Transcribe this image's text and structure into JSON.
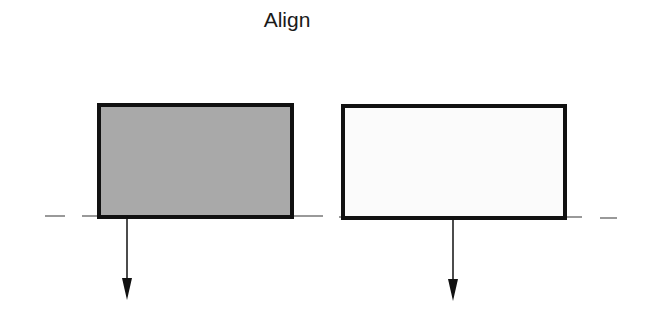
{
  "title": "Align",
  "colors": {
    "stroke": "#111111",
    "left_fill": "#a9a9a9",
    "right_fill": "#fbfbfb",
    "baseline": "#555555"
  },
  "shapes": [
    {
      "name": "left-box",
      "x": 99,
      "y": 105,
      "w": 193,
      "h": 112,
      "fill": "#a9a9a9"
    },
    {
      "name": "right-box",
      "x": 343,
      "y": 106,
      "w": 222,
      "h": 112,
      "fill": "#fbfbfb"
    }
  ],
  "arrows": [
    {
      "x": 127,
      "y1": 217,
      "y2": 300
    },
    {
      "x": 453,
      "y1": 218,
      "y2": 301
    }
  ],
  "baseline_y": 216
}
